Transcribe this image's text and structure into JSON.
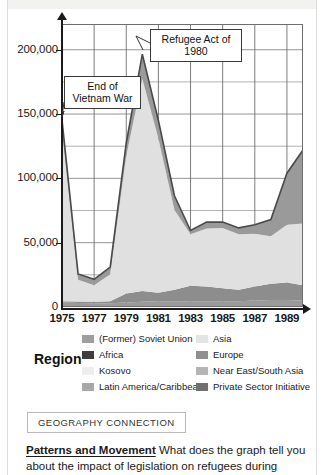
{
  "chart_data": {
    "type": "area",
    "title": "",
    "subtitle": "",
    "xlabel": "",
    "ylabel": "",
    "stacked": true,
    "grid": true,
    "legend_position": "below",
    "xlim": [
      1975,
      1990
    ],
    "ylim": [
      0,
      220000
    ],
    "x": [
      1975,
      1976,
      1977,
      1978,
      1979,
      1980,
      1981,
      1982,
      1983,
      1984,
      1985,
      1986,
      1987,
      1988,
      1989,
      1990
    ],
    "x_tick_labels": [
      "1975",
      "1977",
      "1979",
      "1981",
      "1983",
      "1985",
      "1987",
      "1989"
    ],
    "x_ticks": [
      1975,
      1977,
      1979,
      1981,
      1983,
      1985,
      1987,
      1989
    ],
    "y_ticks": [
      0,
      50000,
      100000,
      150000,
      200000
    ],
    "y_tick_labels": [
      "0",
      "50,000",
      "100,000",
      "150,000",
      "200,000"
    ],
    "series": [
      {
        "name": "Africa",
        "color": "#9a9a9a",
        "values": [
          3500,
          3200,
          3000,
          3000,
          3500,
          4000,
          4500,
          4500,
          4500,
          4500,
          4500,
          4500,
          5000,
          5500,
          5500,
          5000
        ]
      },
      {
        "name": "Latin America/Caribbean",
        "color": "#8d8d8d",
        "values": [
          1000,
          1000,
          1000,
          1500,
          7000,
          8500,
          6500,
          9000,
          12000,
          11500,
          10000,
          9000,
          11000,
          12500,
          13500,
          12000
        ]
      },
      {
        "name": "Asia",
        "color": "#e0e0e0",
        "values": [
          133000,
          17000,
          13000,
          21000,
          107000,
          165000,
          120000,
          62000,
          40000,
          45000,
          47000,
          43000,
          41000,
          37000,
          45000,
          48000
        ]
      },
      {
        "name": "(Former) Soviet Union",
        "color": "#9a9a9a",
        "values": [
          8000,
          4500,
          4500,
          5500,
          10000,
          19000,
          14000,
          11000,
          3000,
          5000,
          4500,
          5000,
          7000,
          13000,
          40000,
          57000
        ]
      }
    ],
    "annotations": [
      {
        "id": "end-of-vietnam-war",
        "label": "End of\nVietnam War",
        "target_x": 1975,
        "target_y": 146000
      },
      {
        "id": "refugee-act-of-1980",
        "label": "Refugee Act of\n1980",
        "target_x": 1980,
        "target_y": 207000
      }
    ]
  },
  "chart": {
    "y_axis": {
      "ticks": [
        {
          "label": "200,000",
          "value": 200000
        },
        {
          "label": "150,000",
          "value": 150000
        },
        {
          "label": "100,000",
          "value": 100000
        },
        {
          "label": "50,000",
          "value": 50000
        },
        {
          "label": "0",
          "value": 0
        }
      ]
    },
    "x_axis": {
      "ticks": [
        {
          "label": "1975"
        },
        {
          "label": "1977"
        },
        {
          "label": "1979"
        },
        {
          "label": "1981"
        },
        {
          "label": "1983"
        },
        {
          "label": "1985"
        },
        {
          "label": "1987"
        },
        {
          "label": "1989"
        }
      ]
    },
    "callouts": {
      "vietnam": {
        "line1": "End of",
        "line2": "Vietnam War"
      },
      "refugee_act": {
        "line1": "Refugee Act of",
        "line2": "1980"
      }
    }
  },
  "legend": {
    "title": "Region",
    "column1": [
      {
        "label": "(Former) Soviet Union",
        "color": "#9e9e9e"
      },
      {
        "label": "Africa",
        "color": "#3d3d3d"
      },
      {
        "label": "Kosovo",
        "color": "#ededed"
      },
      {
        "label": "Latin America/Caribbean",
        "color": "#a8a8a8"
      }
    ],
    "column2": [
      {
        "label": "Asia",
        "color": "#e4e4e4"
      },
      {
        "label": "Europe",
        "color": "#8f8f8f"
      },
      {
        "label": "Near East/South Asia",
        "color": "#b5b5b5"
      },
      {
        "label": "Private Sector Initiative",
        "color": "#707070"
      }
    ]
  },
  "footer": {
    "badge": "GEOGRAPHY CONNECTION",
    "question_heading": "Patterns and Movement",
    "question_text": "What does the graph tell you about the impact of legislation on refugees during"
  }
}
